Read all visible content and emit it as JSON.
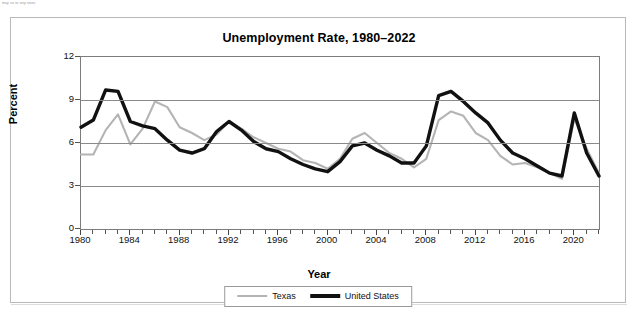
{
  "page": {
    "cropped_header_text": "may us or any noos."
  },
  "card": {
    "title": "Unemployment Rate, 1980–2022"
  },
  "legend": {
    "items": [
      {
        "label": "Texas",
        "color": "#b4b4b4",
        "style": "thin-gray"
      },
      {
        "label": "United States",
        "color": "#111111",
        "style": "thick-black"
      }
    ]
  },
  "axes": {
    "y": {
      "title": "Percent",
      "ticks": [
        "0",
        "3",
        "6",
        "9",
        "12"
      ]
    },
    "x": {
      "title": "Year",
      "ticks": [
        "1980",
        "1984",
        "1988",
        "1992",
        "1996",
        "2000",
        "2004",
        "2008",
        "2012",
        "2016",
        "2020"
      ]
    }
  },
  "chart_data": {
    "type": "line",
    "title": "Unemployment Rate, 1980–2022",
    "xlabel": "Year",
    "ylabel": "Percent",
    "xlim": [
      1980,
      2022
    ],
    "ylim": [
      0,
      12
    ],
    "yticks": [
      0,
      3,
      6,
      9,
      12
    ],
    "xticks": [
      1980,
      1984,
      1988,
      1992,
      1996,
      2000,
      2004,
      2008,
      2012,
      2016,
      2020
    ],
    "grid": "horizontal",
    "legend_position": "bottom-center",
    "x": [
      1980,
      1981,
      1982,
      1983,
      1984,
      1985,
      1986,
      1987,
      1988,
      1989,
      1990,
      1991,
      1992,
      1993,
      1994,
      1995,
      1996,
      1997,
      1998,
      1999,
      2000,
      2001,
      2002,
      2003,
      2004,
      2005,
      2006,
      2007,
      2008,
      2009,
      2010,
      2011,
      2012,
      2013,
      2014,
      2015,
      2016,
      2017,
      2018,
      2019,
      2020,
      2021,
      2022
    ],
    "series": [
      {
        "name": "Texas",
        "color": "#b4b4b4",
        "values": [
          5.2,
          5.2,
          6.9,
          8.0,
          5.9,
          7.0,
          8.9,
          8.5,
          7.1,
          6.7,
          6.2,
          6.6,
          7.5,
          7.0,
          6.4,
          6.0,
          5.6,
          5.4,
          4.8,
          4.6,
          4.2,
          4.9,
          6.3,
          6.7,
          6.0,
          5.3,
          4.9,
          4.3,
          4.9,
          7.6,
          8.2,
          7.9,
          6.7,
          6.2,
          5.1,
          4.5,
          4.6,
          4.3,
          3.9,
          3.5,
          7.7,
          5.6,
          3.9
        ]
      },
      {
        "name": "United States",
        "color": "#111111",
        "values": [
          7.1,
          7.6,
          9.7,
          9.6,
          7.5,
          7.2,
          7.0,
          6.2,
          5.5,
          5.3,
          5.6,
          6.8,
          7.5,
          6.9,
          6.1,
          5.6,
          5.4,
          4.9,
          4.5,
          4.2,
          4.0,
          4.7,
          5.8,
          6.0,
          5.5,
          5.1,
          4.6,
          4.6,
          5.8,
          9.3,
          9.6,
          8.9,
          8.1,
          7.4,
          6.2,
          5.3,
          4.9,
          4.4,
          3.9,
          3.7,
          8.1,
          5.3,
          3.7
        ]
      }
    ]
  }
}
